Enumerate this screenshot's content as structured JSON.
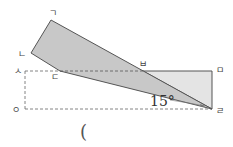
{
  "diagram": {
    "points": {
      "giyeok": "ㄱ",
      "nieun": "ㄴ",
      "digeut": "ㄷ",
      "rieul": "ㄹ",
      "mieum": "ㅁ",
      "bieup": "ㅂ",
      "siot": "ㅅ",
      "ieung": "ㅇ"
    },
    "angle_label": "15°",
    "answer_blank": "(",
    "colors": {
      "folded_fill": "#c8c8c8",
      "triangle_fill": "#e4e4e4",
      "stroke": "#555555",
      "dashed": "#666666"
    }
  }
}
